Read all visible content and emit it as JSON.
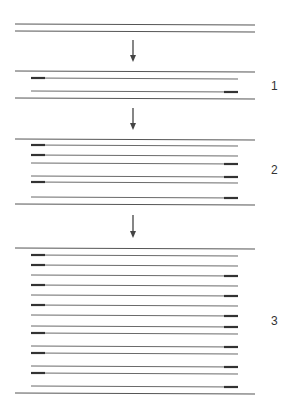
{
  "diagram": {
    "colors": {
      "line": "#6a6a6a",
      "outer_line": "#555555",
      "mark": "#333333",
      "arrow": "#444444",
      "label": "#333333"
    },
    "line_x": {
      "outer_start": 15,
      "outer_end": 255,
      "inner_start": 31,
      "inner_end": 238
    },
    "mark_length": 14,
    "top": {
      "lines_y": [
        24,
        31
      ]
    },
    "arrows": [
      {
        "x": 133,
        "y_start": 40,
        "y_end": 62
      },
      {
        "x": 133,
        "y_start": 108,
        "y_end": 130
      },
      {
        "x": 133,
        "y_start": 215,
        "y_end": 238
      }
    ],
    "stages": [
      {
        "label": "1",
        "label_y": 87,
        "outer_y": [
          71,
          98
        ],
        "strands": [
          {
            "y": 78,
            "mark": "left"
          },
          {
            "y": 91,
            "mark": "right"
          }
        ]
      },
      {
        "label": "2",
        "label_y": 171,
        "outer_y": [
          139,
          204
        ],
        "strands": [
          {
            "y": 145,
            "mark": "left"
          },
          {
            "y": 155,
            "mark": "left"
          },
          {
            "y": 163,
            "mark": "right"
          },
          {
            "y": 176,
            "mark": "right"
          },
          {
            "y": 182,
            "mark": "left"
          },
          {
            "y": 197,
            "mark": "right"
          }
        ]
      },
      {
        "label": "3",
        "label_y": 322,
        "outer_y": [
          248,
          393
        ],
        "strands": [
          {
            "y": 255,
            "mark": "left"
          },
          {
            "y": 265,
            "mark": "left"
          },
          {
            "y": 275,
            "mark": "right"
          },
          {
            "y": 285,
            "mark": "left"
          },
          {
            "y": 295,
            "mark": "right"
          },
          {
            "y": 305,
            "mark": "left"
          },
          {
            "y": 315,
            "mark": "right"
          },
          {
            "y": 326,
            "mark": "right"
          },
          {
            "y": 333,
            "mark": "left"
          },
          {
            "y": 346,
            "mark": "right"
          },
          {
            "y": 353,
            "mark": "left"
          },
          {
            "y": 366,
            "mark": "right"
          },
          {
            "y": 373,
            "mark": "left"
          },
          {
            "y": 386,
            "mark": "right"
          }
        ]
      }
    ],
    "label_x": 271
  }
}
